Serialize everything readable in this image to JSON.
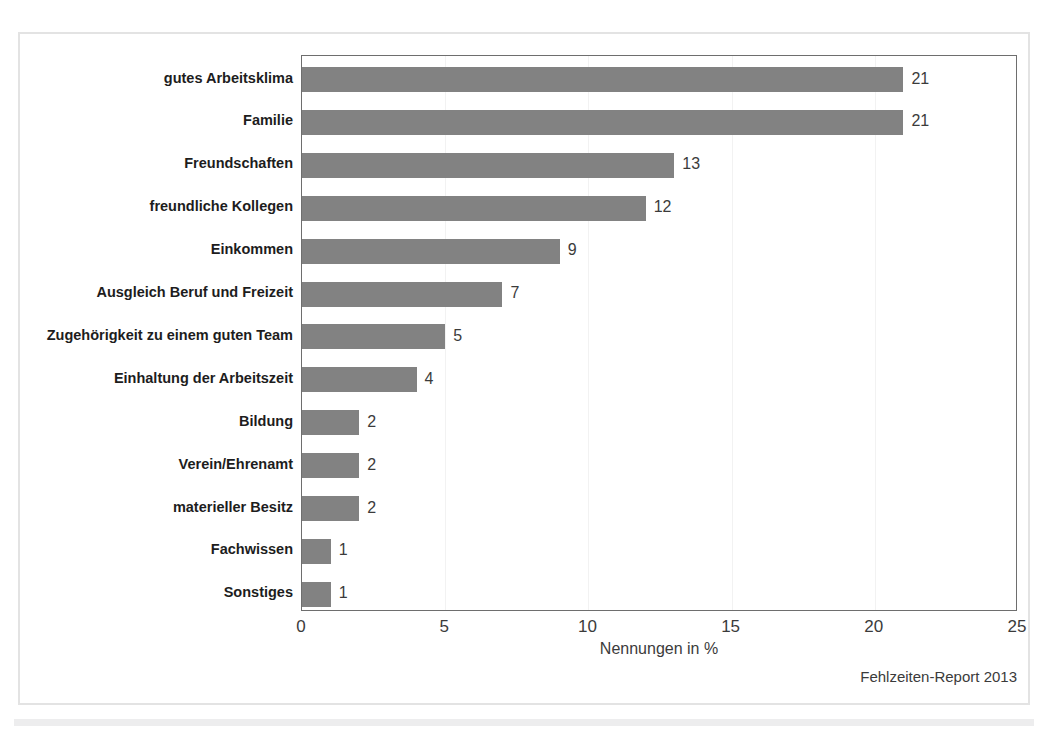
{
  "chart_data": {
    "type": "bar",
    "orientation": "horizontal",
    "title": "",
    "xlabel": "Nennungen in %",
    "ylabel": "",
    "xlim": [
      0,
      25
    ],
    "xticks": [
      "0",
      "5",
      "10",
      "15",
      "20",
      "25"
    ],
    "grid": true,
    "grid_axis": "x",
    "legend": null,
    "bar_color": "#828282",
    "categories": [
      "gutes Arbeitsklima",
      "Familie",
      "Freundschaften",
      "freundliche Kollegen",
      "Einkommen",
      "Ausgleich Beruf und Freizeit",
      "Zugehörigkeit zu einem guten Team",
      "Einhaltung der Arbeitszeit",
      "Bildung",
      "Verein/Ehrenamt",
      "materieller Besitz",
      "Fachwissen",
      "Sonstiges"
    ],
    "values": [
      21,
      21,
      13,
      12,
      9,
      7,
      5,
      4,
      2,
      2,
      2,
      1,
      1
    ],
    "value_labels": [
      "21",
      "21",
      "13",
      "12",
      "9",
      "7",
      "5",
      "4",
      "2",
      "2",
      "2",
      "1",
      "1"
    ]
  },
  "footer": {
    "source": "Fehlzeiten-Report 2013"
  }
}
